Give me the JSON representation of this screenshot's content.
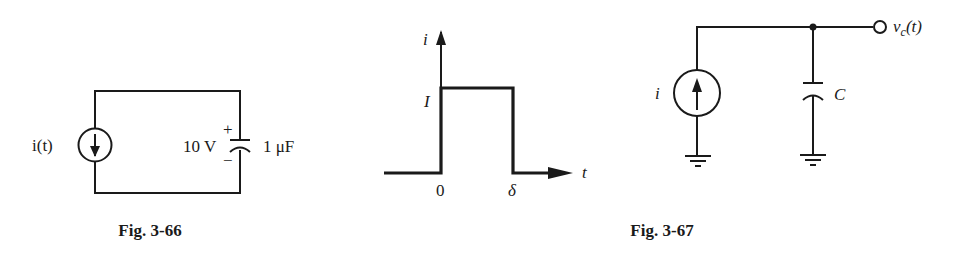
{
  "figures": [
    {
      "caption": "Fig. 3-66",
      "source_label": "i(t)",
      "source_direction": "down",
      "capacitor_voltage": "10 V",
      "capacitor_plus": "+",
      "capacitor_minus": "−",
      "capacitance": "1 μF"
    },
    {
      "caption": "Fig. 3-67",
      "waveform": {
        "y_axis_label": "i",
        "x_axis_label": "t",
        "level_label": "I",
        "start_label": "0",
        "end_label": "δ"
      },
      "circuit": {
        "source_label": "i",
        "source_direction": "up",
        "capacitor_label": "C",
        "output_label": "v",
        "output_subscript": "c",
        "output_suffix": "(t)"
      }
    }
  ]
}
